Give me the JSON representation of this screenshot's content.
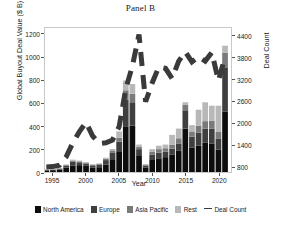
{
  "chart_data": {
    "type": "bar",
    "title": "Panel B",
    "xlabel": "Year",
    "ylabel": "Global Buyout Deal Value ($ B)",
    "ylabel_right": "Deal Count",
    "grid": false,
    "legend_position": "bottom",
    "xlim": [
      1993.8,
      2021.9
    ],
    "ylim": [
      0,
      1260
    ],
    "ylim_right": [
      640,
      4640
    ],
    "xticks": [
      "1995",
      "2000",
      "2005",
      "2010",
      "2015",
      "2020"
    ],
    "xtick_values": [
      1995,
      2000,
      2005,
      2010,
      2015,
      2020
    ],
    "yticks": [
      "0",
      "200",
      "400",
      "600",
      "800",
      "1000",
      "1200"
    ],
    "ytick_values": [
      0,
      200,
      400,
      600,
      800,
      1000,
      1200
    ],
    "yticks_right": [
      "800",
      "1400",
      "2000",
      "2600",
      "3200",
      "3800",
      "4400"
    ],
    "ytick_values_right": [
      800,
      1400,
      2000,
      2600,
      3200,
      3800,
      4400
    ],
    "categories": [
      1994,
      1995,
      1996,
      1997,
      1998,
      1999,
      2000,
      2001,
      2002,
      2003,
      2004,
      2005,
      2006,
      2007,
      2008,
      2009,
      2010,
      2011,
      2012,
      2013,
      2014,
      2015,
      2016,
      2017,
      2018,
      2019,
      2020,
      2021
    ],
    "series": [
      {
        "name": "North America",
        "color": "#0d0d0d",
        "values": [
          14,
          16,
          21,
          38,
          57,
          60,
          54,
          40,
          42,
          66,
          105,
          175,
          400,
          405,
          140,
          40,
          105,
          120,
          130,
          150,
          185,
          380,
          215,
          230,
          255,
          250,
          195,
          530
        ]
      },
      {
        "name": "Europe",
        "color": "#3f3f3f",
        "values": [
          4,
          5,
          8,
          18,
          35,
          25,
          20,
          18,
          22,
          38,
          62,
          90,
          230,
          205,
          60,
          15,
          45,
          50,
          48,
          55,
          65,
          160,
          95,
          115,
          125,
          130,
          95,
          380
        ]
      },
      {
        "name": "Asia Pacific",
        "color": "#7a7a7a",
        "values": [
          2,
          2,
          3,
          5,
          8,
          8,
          8,
          6,
          7,
          12,
          22,
          35,
          85,
          75,
          20,
          8,
          25,
          30,
          30,
          35,
          45,
          50,
          45,
          60,
          65,
          70,
          60,
          135
        ]
      },
      {
        "name": "Rest",
        "color": "#b8b8b8",
        "values": [
          2,
          2,
          3,
          5,
          8,
          7,
          5,
          4,
          5,
          9,
          12,
          55,
          85,
          85,
          20,
          7,
          25,
          30,
          32,
          85,
          85,
          20,
          55,
          140,
          165,
          130,
          230,
          60
        ]
      }
    ],
    "line_series": {
      "name": "Deal Count",
      "style": "dashed",
      "color": "#3a3a3a",
      "x": [
        1994,
        1995,
        1996,
        1997,
        1998,
        1999,
        2000,
        2001,
        2002,
        2003,
        2004,
        2005,
        2006,
        2007,
        2008,
        2009,
        2010,
        2011,
        2012,
        2013,
        2014,
        2015,
        2016,
        2017,
        2018,
        2019,
        2020,
        2021
      ],
      "values": [
        780,
        790,
        830,
        1060,
        1450,
        1760,
        2020,
        1640,
        1430,
        1450,
        1530,
        1900,
        2950,
        3580,
        4460,
        2590,
        3120,
        3560,
        3520,
        3240,
        3720,
        3980,
        3700,
        3840,
        3720,
        3960,
        3180,
        3840
      ]
    }
  },
  "legend": {
    "items": [
      {
        "label": "North America",
        "color": "#0d0d0d",
        "kind": "swatch"
      },
      {
        "label": "Europe",
        "color": "#3f3f3f",
        "kind": "swatch"
      },
      {
        "label": "Asia Pacific",
        "color": "#7a7a7a",
        "kind": "swatch"
      },
      {
        "label": "Rest",
        "color": "#b8b8b8",
        "kind": "swatch"
      },
      {
        "label": "Deal Count",
        "color": "#3a3a3a",
        "kind": "dash"
      }
    ]
  }
}
